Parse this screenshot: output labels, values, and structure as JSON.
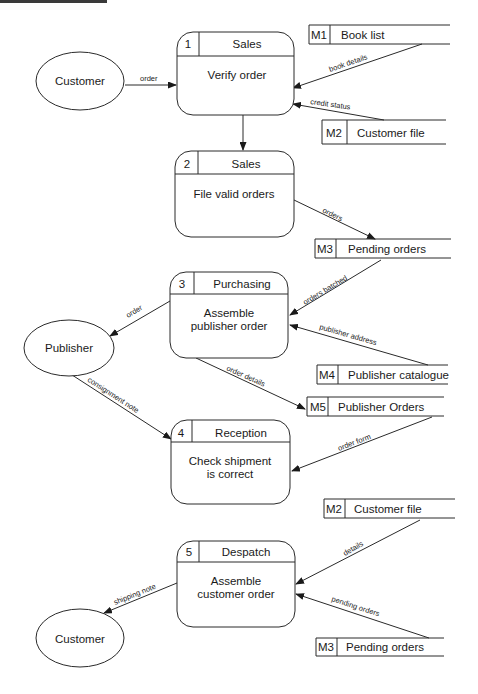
{
  "diagram": {
    "type": "data-flow-diagram",
    "entities": {
      "customer_top": "Customer",
      "publisher": "Publisher",
      "customer_bottom": "Customer"
    },
    "processes": [
      {
        "num": "1",
        "dept": "Sales",
        "line1": "Verify order",
        "line2": ""
      },
      {
        "num": "2",
        "dept": "Sales",
        "line1": "File valid orders",
        "line2": ""
      },
      {
        "num": "3",
        "dept": "Purchasing",
        "line1": "Assemble",
        "line2": "publisher order"
      },
      {
        "num": "4",
        "dept": "Reception",
        "line1": "Check shipment",
        "line2": "is correct"
      },
      {
        "num": "5",
        "dept": "Despatch",
        "line1": "Assemble",
        "line2": "customer order"
      }
    ],
    "stores": [
      {
        "id": "M1",
        "name": "Book list"
      },
      {
        "id": "M2",
        "name": "Customer file"
      },
      {
        "id": "M3",
        "name": "Pending orders"
      },
      {
        "id": "M4",
        "name": "Publisher catalogue"
      },
      {
        "id": "M5",
        "name": "Publisher Orders"
      },
      {
        "id": "M2",
        "name": "Customer file"
      },
      {
        "id": "M3",
        "name": "Pending orders"
      }
    ],
    "flows": {
      "order_in": "order",
      "book_details": "book details",
      "credit_status": "credit status",
      "orders": "orders",
      "orders_batched": "orders batched",
      "order_out": "order",
      "publisher_address": "publisher address",
      "order_details": "order details",
      "consignment_note": "consignment note",
      "order_form": "order form",
      "details": "details",
      "pending_orders": "pending orders",
      "shipping_note": "shipping note"
    }
  }
}
